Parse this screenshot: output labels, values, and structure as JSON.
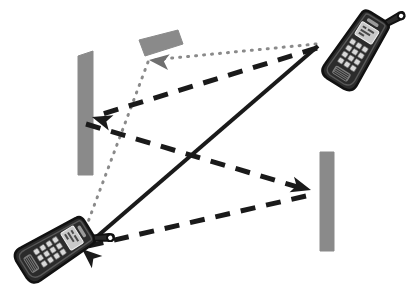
{
  "figure": {
    "background_color": "#ffffff",
    "width": 407,
    "height": 304
  },
  "colors": {
    "wall_fill": "#8a8a8a",
    "wall_stroke": "#8a8a8a",
    "path_dark": "#1a1a1a",
    "path_dotted": "#8a8a8a",
    "phone_body": "#2b2b2b",
    "phone_outline": "#111111",
    "phone_screen": "#c9c9c9",
    "phone_key": "#d8d8d8",
    "white": "#ffffff"
  },
  "walls": [
    {
      "name": "upper-horizontal-wall",
      "label": "Reflecting wall (upper, horizontal)",
      "points": "139,40 178,30 183,44 145,56",
      "fill": "#8a8a8a"
    },
    {
      "name": "left-vertical-wall",
      "label": "Reflecting wall (left, vertical)",
      "points": "78,56 93,51 93,175 78,175",
      "fill": "#8a8a8a"
    },
    {
      "name": "right-vertical-wall",
      "label": "Reflecting wall (right, vertical)",
      "points": "320,152 334,152 334,251 320,251",
      "fill": "#8a8a8a"
    }
  ],
  "phones": [
    {
      "name": "phone-top-right",
      "label": "Mobile handset (transmitter, upper right)",
      "cx": 355,
      "cy": 52,
      "rotation": 32,
      "scale": 1.0
    },
    {
      "name": "phone-bottom-left",
      "label": "Mobile handset (receiver, lower left)",
      "cx": 53,
      "cy": 250,
      "rotation": 58,
      "scale": 1.0
    }
  ],
  "paths": [
    {
      "name": "dotted-reflected-path",
      "label": "Dotted propagation path: handset (upper right) reflects off upper horizontal wall to handset (lower left)",
      "style": "dotted",
      "color": "#8a8a8a",
      "width": 3,
      "dash": "1,7",
      "segments": [
        {
          "from": [
            316,
            44
          ],
          "to": [
            152,
            60
          ]
        },
        {
          "from": [
            148,
            62
          ],
          "to": [
            82,
            238
          ]
        }
      ],
      "arrowheads": [
        {
          "at": [
            149,
            60
          ],
          "angle": 186,
          "color": "#6f6f6f"
        }
      ]
    },
    {
      "name": "dashed-multi-reflection-path",
      "label": "Dashed propagation path: handset (upper right) to left wall, then to right wall, then to handset (lower left)",
      "style": "dashed",
      "color": "#1a1a1a",
      "width": 5,
      "dash": "15,11",
      "segments": [
        {
          "from": [
            317,
            48
          ],
          "to": [
            96,
            116
          ]
        },
        {
          "from": [
            86,
            124
          ],
          "to": [
            308,
            190
          ]
        },
        {
          "from": [
            306,
            196
          ],
          "to": [
            84,
            247
          ]
        }
      ],
      "arrowheads": [
        {
          "at": [
            92,
            117
          ],
          "angle": 197,
          "color": "#1a1a1a"
        },
        {
          "at": [
            311,
            190
          ],
          "angle": 16,
          "color": "#1a1a1a"
        }
      ]
    },
    {
      "name": "solid-direct-path",
      "label": "Solid direct line-of-sight path from handset (upper right) to handset (lower left)",
      "style": "solid",
      "color": "#1a1a1a",
      "width": 4,
      "dash": "none",
      "segments": [
        {
          "from": [
            318,
            46
          ],
          "to": [
            86,
            246
          ]
        }
      ],
      "arrowheads": [
        {
          "at": [
            82,
            249
          ],
          "angle": 221,
          "color": "#1a1a1a"
        }
      ]
    }
  ]
}
